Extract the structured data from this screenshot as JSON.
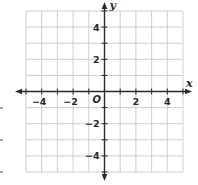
{
  "chart_data": {
    "type": "coordinate-grid",
    "title": "",
    "xlabel": "x",
    "ylabel": "y",
    "xlim": [
      -5,
      5
    ],
    "ylim": [
      -5,
      5
    ],
    "grid": true,
    "grid_step": 1,
    "x_tick_labels": [
      {
        "value": -4,
        "label": "−4"
      },
      {
        "value": -2,
        "label": "−2"
      },
      {
        "value": 2,
        "label": "2"
      },
      {
        "value": 4,
        "label": "4"
      }
    ],
    "y_tick_labels": [
      {
        "value": 4,
        "label": "4"
      },
      {
        "value": 2,
        "label": "2"
      },
      {
        "value": -2,
        "label": "−2"
      },
      {
        "value": -4,
        "label": "−4"
      }
    ],
    "origin_label": "O",
    "series": []
  },
  "colors": {
    "grid": "#c8c8c8",
    "axis": "#2a2a2a",
    "text": "#2a2a2a",
    "background": "#ffffff"
  },
  "layout": {
    "x0_px": 26,
    "x1_px": 183,
    "y0_px": 11,
    "y1_px": 172,
    "origin_x_px": 104.5,
    "origin_y_px": 92
  },
  "margin_marks_y_px": [
    108,
    140,
    172
  ]
}
